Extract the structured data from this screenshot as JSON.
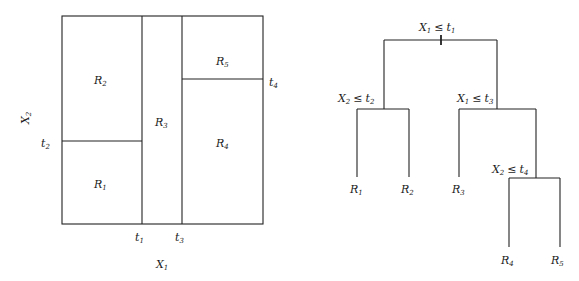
{
  "partition": {
    "regions": [
      {
        "id": "R1",
        "base": "R",
        "sub": "1"
      },
      {
        "id": "R2",
        "base": "R",
        "sub": "2"
      },
      {
        "id": "R3",
        "base": "R",
        "sub": "3"
      },
      {
        "id": "R4",
        "base": "R",
        "sub": "4"
      },
      {
        "id": "R5",
        "base": "R",
        "sub": "5"
      }
    ],
    "thresholds": {
      "t1": {
        "base": "t",
        "sub": "1"
      },
      "t2": {
        "base": "t",
        "sub": "2"
      },
      "t3": {
        "base": "t",
        "sub": "3"
      },
      "t4": {
        "base": "t",
        "sub": "4"
      }
    },
    "axes": {
      "x": {
        "base": "X",
        "sub": "1"
      },
      "y": {
        "base": "X",
        "sub": "2"
      }
    }
  },
  "tree": {
    "nodes": [
      {
        "id": "root",
        "var": "X",
        "var_sub": "1",
        "op": "≤",
        "thr": "t",
        "thr_sub": "1"
      },
      {
        "id": "left",
        "var": "X",
        "var_sub": "2",
        "op": "≤",
        "thr": "t",
        "thr_sub": "2"
      },
      {
        "id": "right",
        "var": "X",
        "var_sub": "1",
        "op": "≤",
        "thr": "t",
        "thr_sub": "3"
      },
      {
        "id": "rr",
        "var": "X",
        "var_sub": "2",
        "op": "≤",
        "thr": "t",
        "thr_sub": "4"
      }
    ],
    "leaves": [
      {
        "base": "R",
        "sub": "1"
      },
      {
        "base": "R",
        "sub": "2"
      },
      {
        "base": "R",
        "sub": "3"
      },
      {
        "base": "R",
        "sub": "4"
      },
      {
        "base": "R",
        "sub": "5"
      }
    ]
  }
}
